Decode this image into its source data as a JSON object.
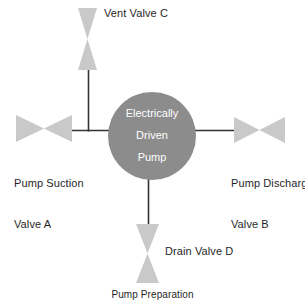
{
  "diagram": {
    "title": "Pump Preparation",
    "caption": "Pump Preparation",
    "pump": {
      "line1": "Electrically",
      "line2": "Driven",
      "line3": "Pump",
      "shape": "circle",
      "fill_color": "#8c8c8c",
      "text_color": "#ffffff",
      "center_x": 152,
      "center_y": 136,
      "radius": 44
    },
    "colors": {
      "valve_fill": "#c9c9c9",
      "pipe_line": "#333333",
      "background": "#ffffff",
      "label_text": "#1f1f1f"
    },
    "valves": [
      {
        "id": "vent-valve-c",
        "label": "Vent Valve C",
        "orientation": "vertical",
        "position": "top",
        "x": 78,
        "y": 8,
        "width": 19,
        "height": 62
      },
      {
        "id": "pump-suction-valve-a",
        "label_line1": "Pump Suction",
        "label_line2": "Valve A",
        "orientation": "horizontal",
        "position": "left",
        "x": 16,
        "y": 115,
        "width": 56,
        "height": 27
      },
      {
        "id": "pump-discharge-valve-b",
        "label_line1": "Pump Discharge",
        "label_line2": "Valve B",
        "orientation": "horizontal",
        "position": "right",
        "x": 234,
        "y": 117,
        "width": 51,
        "height": 26
      },
      {
        "id": "drain-valve-d",
        "label": "Drain Valve D",
        "orientation": "vertical",
        "position": "bottom",
        "x": 136,
        "y": 224,
        "width": 23,
        "height": 59
      }
    ],
    "pipes": [
      {
        "id": "pipe-suction",
        "from": "pump-suction-valve-a",
        "to": "pump",
        "x1": 70,
        "y1": 130,
        "x2": 110,
        "y2": 130
      },
      {
        "id": "pipe-discharge",
        "from": "pump",
        "to": "pump-discharge-valve-b",
        "x1": 195,
        "y1": 130,
        "x2": 236,
        "y2": 130
      },
      {
        "id": "pipe-vent",
        "from": "vent-valve-c",
        "to": "pipe-suction",
        "x1": 88,
        "y1": 68,
        "x2": 88,
        "y2": 131
      },
      {
        "id": "pipe-drain",
        "from": "pump",
        "to": "drain-valve-d",
        "x1": 148,
        "y1": 178,
        "x2": 148,
        "y2": 226
      }
    ]
  }
}
